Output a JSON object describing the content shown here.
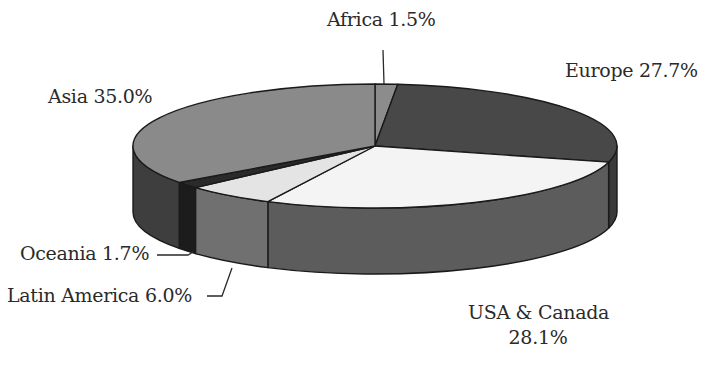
{
  "chart_data": {
    "type": "pie",
    "style": "3d",
    "title": "",
    "start_angle_deg": -90,
    "direction": "clockwise",
    "slices": [
      {
        "label": "Africa",
        "value": 1.5,
        "display": "Africa 1.5%",
        "top_color": "#8c8c8c",
        "side_color": "#5c5c5c"
      },
      {
        "label": "Europe",
        "value": 27.7,
        "display": "Europe 27.7%",
        "top_color": "#484848",
        "side_color": "#3a3a3a"
      },
      {
        "label": "USA & Canada",
        "value": 28.1,
        "display_line1": "USA & Canada",
        "display_line2": "28.1%",
        "top_color": "#f4f4f4",
        "side_color": "#5c5c5c"
      },
      {
        "label": "Latin America",
        "value": 6.0,
        "display": "Latin America 6.0%",
        "top_color": "#e4e4e4",
        "side_color": "#707070"
      },
      {
        "label": "Oceania",
        "value": 1.7,
        "display": "Oceania 1.7%",
        "top_color": "#2a2a2a",
        "side_color": "#1c1c1c"
      },
      {
        "label": "Asia",
        "value": 35.0,
        "display": "Asia 35.0%",
        "top_color": "#8a8a8a",
        "side_color": "#3e3e3e"
      }
    ],
    "legend": "none (labels on slices with leader lines)"
  },
  "labels": {
    "africa": "Africa 1.5%",
    "europe": "Europe 27.7%",
    "usa_line1": "USA & Canada",
    "usa_line2": "28.1%",
    "latin_america": "Latin America 6.0%",
    "oceania": "Oceania 1.7%",
    "asia": "Asia 35.0%"
  }
}
